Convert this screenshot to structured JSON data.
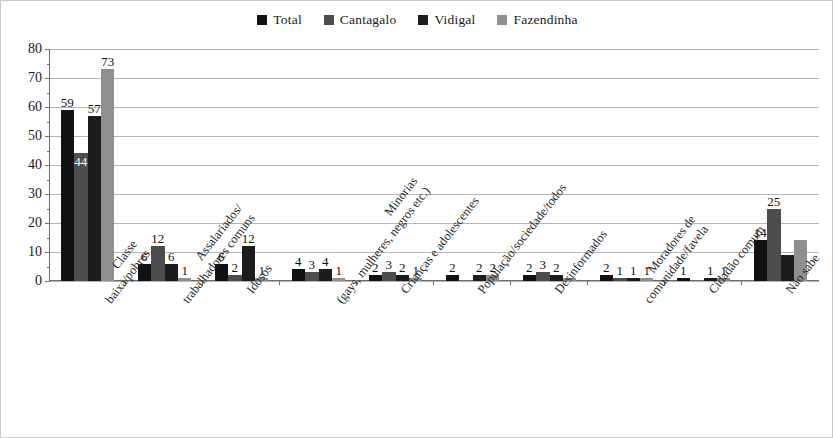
{
  "legend": {
    "items": [
      {
        "label": "Total",
        "color": "#111111"
      },
      {
        "label": "Cantagalo",
        "color": "#4d4d4d"
      },
      {
        "label": "Vidigal",
        "color": "#1c1c1c"
      },
      {
        "label": "Fazendinha",
        "color": "#8f8f8f"
      }
    ]
  },
  "yaxis": {
    "ticks": [
      "0",
      "10",
      "20",
      "30",
      "40",
      "50",
      "60",
      "70",
      "80"
    ]
  },
  "chart_data": {
    "type": "bar",
    "title": "",
    "subtitle": "",
    "xlabel": "",
    "ylabel": "",
    "ylim": [
      0,
      80
    ],
    "ytick_step": 10,
    "grid": true,
    "legend_position": "top-center",
    "orientation": "vertical",
    "grouping": "clustered",
    "categories": [
      "Classe baixa/pobres",
      "Assalariados/trabalhadores comuns",
      "Idosos",
      "Minorias (gays, mulheres, negros etc.)",
      "Crianças e adolescentes",
      "População/sociedade/todos",
      "Desinformados",
      "Moradores de comunidade/favela",
      "Cidadão comum",
      "Não sabe"
    ],
    "category_lines": [
      [
        "Classe",
        "baixa/pobres"
      ],
      [
        "Assalariados/",
        "trabalhadores comuns"
      ],
      [
        "Idosos"
      ],
      [
        "Minorias",
        "(gays, mulheres, negros etc.)"
      ],
      [
        "Crianças e adolescentes"
      ],
      [
        "População/sociedade/todos"
      ],
      [
        "Desinformados"
      ],
      [
        "Moradores de",
        "comunidade/favela"
      ],
      [
        "Cidadão comum"
      ],
      [
        "Não sabe"
      ]
    ],
    "series": [
      {
        "name": "Total",
        "color": "#111111",
        "values": [
          59,
          6,
          6,
          4,
          2,
          2,
          2,
          2,
          1,
          14
        ]
      },
      {
        "name": "Cantagalo",
        "color": "#4d4d4d",
        "values": [
          44,
          12,
          2,
          3,
          3,
          0,
          3,
          1,
          0,
          25
        ]
      },
      {
        "name": "Vidigal",
        "color": "#1c1c1c",
        "values": [
          57,
          6,
          12,
          4,
          2,
          2,
          2,
          1,
          1,
          9
        ]
      },
      {
        "name": "Fazendinha",
        "color": "#8f8f8f",
        "values": [
          73,
          1,
          1,
          1,
          1,
          2,
          1,
          1,
          1,
          14
        ]
      }
    ],
    "value_labels": [
      [
        "59",
        "44",
        "57",
        "73"
      ],
      [
        "6",
        "12",
        "6",
        "1"
      ],
      [
        "6",
        "2",
        "12",
        "1"
      ],
      [
        "4",
        "3",
        "4",
        "1"
      ],
      [
        "2",
        "3",
        "2",
        "1"
      ],
      [
        "2",
        "",
        "2",
        "2"
      ],
      [
        "2",
        "3",
        "2",
        ""
      ],
      [
        "2",
        "1",
        "1",
        "1"
      ],
      [
        "1",
        "",
        "1",
        "1"
      ],
      [
        "14",
        "25",
        "",
        ""
      ]
    ]
  }
}
